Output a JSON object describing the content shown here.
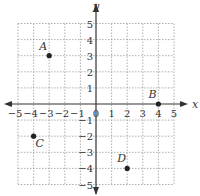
{
  "diagram": {
    "type": "coordinate-plane",
    "x_axis": {
      "label": "x",
      "min": -5,
      "max": 5,
      "ticks": [
        "-5",
        "-4",
        "-3",
        "-2",
        "-1",
        "0",
        "1",
        "2",
        "3",
        "4",
        "5"
      ]
    },
    "y_axis": {
      "label": "y",
      "min": -5,
      "max": 5,
      "ticks": [
        "5",
        "4",
        "3",
        "2",
        "1",
        "-1",
        "-2",
        "-3",
        "-4",
        "-5"
      ]
    },
    "grid": {
      "style": "dotted",
      "step": 1
    },
    "points": [
      {
        "label": "A",
        "x": -3,
        "y": 3
      },
      {
        "label": "B",
        "x": 4,
        "y": 0
      },
      {
        "label": "C",
        "x": -4,
        "y": -2
      },
      {
        "label": "D",
        "x": 2,
        "y": -4
      }
    ],
    "colors": {
      "axis": "#333333",
      "grid": "#9a9a9a",
      "point": "#222222"
    }
  }
}
